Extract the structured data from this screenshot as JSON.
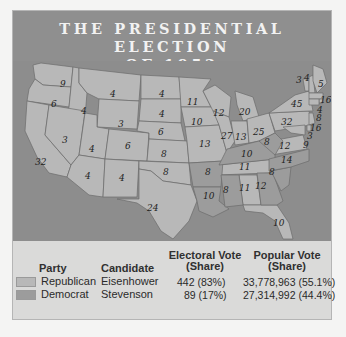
{
  "title": {
    "line1": "THE PRESIDENTIAL ELECTION",
    "line2": "OF 1952"
  },
  "colors": {
    "title_bg": "#8f8f8f",
    "water": "#8d8d8d",
    "republican": "#b8b8b8",
    "democrat": "#9c9c9c",
    "state_border": "#6c6c6c",
    "legend_bg": "#dadad9"
  },
  "map": {
    "states": [
      {
        "state": "Washington",
        "electoral_votes": "9",
        "party": "republican"
      },
      {
        "state": "Oregon",
        "electoral_votes": "6",
        "party": "republican"
      },
      {
        "state": "California",
        "electoral_votes": "32",
        "party": "republican"
      },
      {
        "state": "Idaho",
        "electoral_votes": "4",
        "party": "republican"
      },
      {
        "state": "Nevada",
        "electoral_votes": "3",
        "party": "republican"
      },
      {
        "state": "Montana",
        "electoral_votes": "4",
        "party": "republican"
      },
      {
        "state": "Wyoming",
        "electoral_votes": "3",
        "party": "republican"
      },
      {
        "state": "Utah",
        "electoral_votes": "4",
        "party": "republican"
      },
      {
        "state": "Colorado",
        "electoral_votes": "6",
        "party": "republican"
      },
      {
        "state": "Arizona",
        "electoral_votes": "4",
        "party": "republican"
      },
      {
        "state": "New Mexico",
        "electoral_votes": "4",
        "party": "republican"
      },
      {
        "state": "North Dakota",
        "electoral_votes": "4",
        "party": "republican"
      },
      {
        "state": "South Dakota",
        "electoral_votes": "4",
        "party": "republican"
      },
      {
        "state": "Nebraska",
        "electoral_votes": "6",
        "party": "republican"
      },
      {
        "state": "Kansas",
        "electoral_votes": "8",
        "party": "republican"
      },
      {
        "state": "Oklahoma",
        "electoral_votes": "8",
        "party": "republican"
      },
      {
        "state": "Texas",
        "electoral_votes": "24",
        "party": "republican"
      },
      {
        "state": "Minnesota",
        "electoral_votes": "11",
        "party": "republican"
      },
      {
        "state": "Iowa",
        "electoral_votes": "10",
        "party": "republican"
      },
      {
        "state": "Missouri",
        "electoral_votes": "13",
        "party": "republican"
      },
      {
        "state": "Arkansas",
        "electoral_votes": "8",
        "party": "democrat"
      },
      {
        "state": "Louisiana",
        "electoral_votes": "10",
        "party": "democrat"
      },
      {
        "state": "Wisconsin",
        "electoral_votes": "12",
        "party": "republican"
      },
      {
        "state": "Illinois",
        "electoral_votes": "27",
        "party": "republican"
      },
      {
        "state": "Michigan",
        "electoral_votes": "20",
        "party": "republican"
      },
      {
        "state": "Indiana",
        "electoral_votes": "13",
        "party": "republican"
      },
      {
        "state": "Ohio",
        "electoral_votes": "25",
        "party": "republican"
      },
      {
        "state": "Kentucky",
        "electoral_votes": "10",
        "party": "democrat"
      },
      {
        "state": "Tennessee",
        "electoral_votes": "11",
        "party": "republican"
      },
      {
        "state": "Mississippi",
        "electoral_votes": "8",
        "party": "democrat"
      },
      {
        "state": "Alabama",
        "electoral_votes": "11",
        "party": "democrat"
      },
      {
        "state": "Georgia",
        "electoral_votes": "12",
        "party": "democrat"
      },
      {
        "state": "Florida",
        "electoral_votes": "10",
        "party": "republican"
      },
      {
        "state": "South Carolina",
        "electoral_votes": "8",
        "party": "democrat"
      },
      {
        "state": "North Carolina",
        "electoral_votes": "14",
        "party": "democrat"
      },
      {
        "state": "Virginia",
        "electoral_votes": "12",
        "party": "republican"
      },
      {
        "state": "West Virginia",
        "electoral_votes": "8",
        "party": "democrat"
      },
      {
        "state": "Pennsylvania",
        "electoral_votes": "32",
        "party": "republican"
      },
      {
        "state": "New York",
        "electoral_votes": "45",
        "party": "republican"
      },
      {
        "state": "Vermont",
        "electoral_votes": "3",
        "party": "republican"
      },
      {
        "state": "New Hampshire",
        "electoral_votes": "4",
        "party": "republican"
      },
      {
        "state": "Maine",
        "electoral_votes": "5",
        "party": "republican"
      },
      {
        "state": "Massachusetts",
        "electoral_votes": "16",
        "party": "republican"
      },
      {
        "state": "Rhode Island",
        "electoral_votes": "4",
        "party": "republican"
      },
      {
        "state": "Connecticut",
        "electoral_votes": "8",
        "party": "republican"
      },
      {
        "state": "New Jersey",
        "electoral_votes": "16",
        "party": "republican"
      },
      {
        "state": "Delaware",
        "electoral_votes": "3",
        "party": "republican"
      },
      {
        "state": "Maryland",
        "electoral_votes": "9",
        "party": "republican"
      }
    ]
  },
  "legend": {
    "headers": {
      "party": "Party",
      "candidate": "Candidate",
      "electoral_line1": "Electoral Vote",
      "electoral_line2": "(Share)",
      "popular_line1": "Popular Vote",
      "popular_line2": "(Share)"
    },
    "rows": [
      {
        "party": "Republican",
        "candidate": "Eisenhower",
        "electoral": "442 (83%)",
        "popular": "33,778,963 (55.1%)"
      },
      {
        "party": "Democrat",
        "candidate": "Stevenson",
        "electoral": "89 (17%)",
        "popular": "27,314,992 (44.4%)"
      }
    ]
  }
}
